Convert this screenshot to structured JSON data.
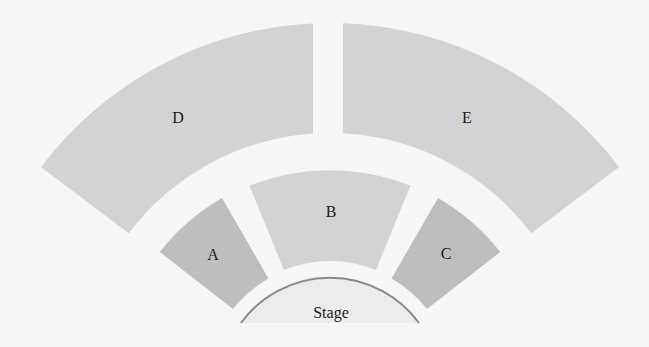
{
  "diagram": {
    "type": "seating-chart",
    "background": "#f7f7f7",
    "colors": {
      "upper_sections": "#d3d3d3",
      "center_section": "#d3d3d3",
      "side_sections": "#bebebe",
      "stage_fill": "#ececec",
      "stage_line": "#8a8a8a"
    },
    "sections": [
      {
        "id": "A",
        "label": "A"
      },
      {
        "id": "B",
        "label": "B"
      },
      {
        "id": "C",
        "label": "C"
      },
      {
        "id": "D",
        "label": "D"
      },
      {
        "id": "E",
        "label": "E"
      }
    ],
    "stage": {
      "label": "Stage"
    }
  }
}
